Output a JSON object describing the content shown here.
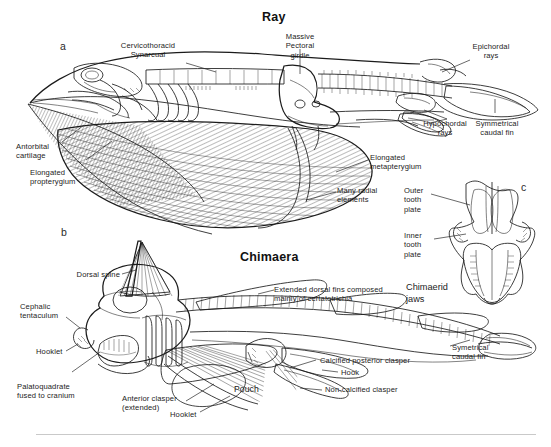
{
  "figure": {
    "background_color": "#ffffff",
    "ink_color": "#1b1b1b",
    "label_color": "#232323"
  },
  "titles": {
    "ray": "Ray",
    "chimaera": "Chimaera"
  },
  "panel_letters": {
    "a": "a",
    "b": "b",
    "c": "c"
  },
  "ray_labels": {
    "cervicothoracic_synarcual": "Cervicothoracid\nSynarcual",
    "massive_pectoral_girdle": "Massive\nPectoral\ngirdle",
    "epichordal_rays": "Epichordal\nrays",
    "hypochordal_rays": "Hypochordal\nrays",
    "symmetrical_caudal_fin": "Symmetrical\ncaudal fin",
    "antorbital_cartilage": "Antorbital\ncartilage",
    "elongated_propterygium": "Elongated\npropterygium",
    "elongated_metapterygium": "Elongated\nmetapterygium",
    "many_radial_elements": "Many radial\nelements"
  },
  "jaw_labels": {
    "outer_tooth_plate": "Outer\ntooth\nplate",
    "inner_tooth_plate": "Inner\ntooth\nplate",
    "chimaerid_jaws": "Chimaerid\njaws"
  },
  "chimaera_labels": {
    "dorsal_spine": "Dorsal spine",
    "cephalic_tentaculum": "Cephalic\ntentaculum",
    "hooklet_upper": "Hooklet",
    "palatoquadrate_fused": "Palatoquadrate\nfused to cranium",
    "anterior_clasper": "Anterior clasper\n(extended)",
    "hooklet_lower": "Hooklet",
    "pouch": "Pouch",
    "extended_dorsal_fins": "Extended dorsal fins composed\nmainly of certatotrichia",
    "calcified_posterior_clasper": "Calcified posterior clasper",
    "hook": "Hook",
    "non_calcified_clasper": "Non-calcified clasper",
    "symmetrical_caudal_fin": "Symetrical\ncaudal fin"
  }
}
